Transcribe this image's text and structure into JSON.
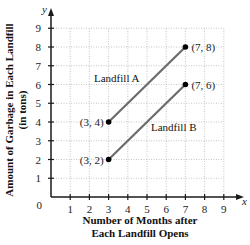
{
  "chart_data": {
    "type": "line",
    "title": "",
    "xlabel_lines": [
      "Number of Months after",
      "Each Landfill Opens"
    ],
    "ylabel_lines": [
      "Amount of Garbage in Each Landfill",
      "(in tons)"
    ],
    "x_var": "x",
    "y_var": "y",
    "xlim": [
      0,
      9
    ],
    "ylim": [
      0,
      9
    ],
    "origin_label": "0",
    "x_ticks": [
      1,
      2,
      3,
      4,
      5,
      6,
      7,
      8,
      9
    ],
    "y_ticks": [
      1,
      2,
      3,
      4,
      5,
      6,
      7,
      8,
      9
    ],
    "grid": true,
    "legend": "inline labels",
    "series": [
      {
        "name": "Landfill A",
        "points": [
          {
            "x": 3,
            "y": 4,
            "label": "(3, 4)"
          },
          {
            "x": 7,
            "y": 8,
            "label": "(7, 8)"
          }
        ]
      },
      {
        "name": "Landfill B",
        "points": [
          {
            "x": 3,
            "y": 2,
            "label": "(3, 2)"
          },
          {
            "x": 7,
            "y": 6,
            "label": "(7, 6)"
          }
        ]
      }
    ]
  },
  "colors": {
    "line": "#6b6b6b",
    "point": "#000000",
    "axis": "#1a1a1a",
    "grid": "#b8b8b8"
  }
}
